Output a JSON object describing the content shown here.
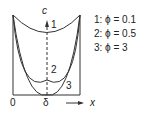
{
  "diagram": {
    "axis_label_c": "c",
    "axis_label_x": "x",
    "origin_label": "0",
    "center_label": "δ",
    "curve_labels": [
      "1",
      "2",
      "3"
    ],
    "legend": [
      {
        "label": "1: ϕ = 0.1"
      },
      {
        "label": "2: ϕ = 0.5"
      },
      {
        "label": "3: ϕ = 3"
      }
    ]
  }
}
